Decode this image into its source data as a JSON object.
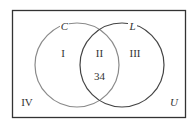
{
  "diagram": {
    "type": "venn",
    "universe_label": "U",
    "sets": [
      {
        "name": "C",
        "color": "#888888"
      },
      {
        "name": "L",
        "color": "#444444"
      }
    ],
    "regions": {
      "I": "I",
      "II": "II",
      "III": "III",
      "IV": "IV"
    },
    "values": {
      "II": "34"
    }
  }
}
